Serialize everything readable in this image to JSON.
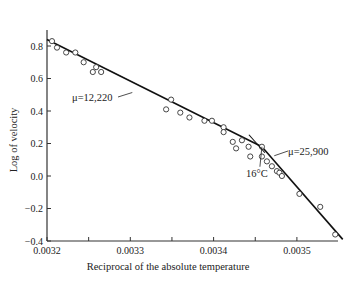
{
  "chart_data": {
    "type": "scatter",
    "title": "",
    "xlabel": "Reciprocal of the absolute temperature",
    "ylabel": "Log of velocity",
    "xlim": [
      0.0032,
      0.003555
    ],
    "ylim": [
      -0.4,
      0.9
    ],
    "xticks": [
      0.0032,
      0.0033,
      0.0034,
      0.0035
    ],
    "xtick_labels": [
      "0.0032",
      "0.0033",
      "0.0034",
      "0.0035"
    ],
    "x_minor_ticks": [
      0.00325,
      0.00335,
      0.00345
    ],
    "yticks": [
      0.8,
      0.6,
      0.4,
      0.2,
      0.0,
      -0.2,
      -0.4
    ],
    "ytick_labels": [
      "0.8",
      "0.6",
      "0.4",
      "0.2",
      "0.0",
      "−0.2",
      "−0.4"
    ],
    "grid": false,
    "points": [
      {
        "x": 0.003206,
        "y": 0.83
      },
      {
        "x": 0.003212,
        "y": 0.79
      },
      {
        "x": 0.003223,
        "y": 0.76
      },
      {
        "x": 0.003234,
        "y": 0.76
      },
      {
        "x": 0.003244,
        "y": 0.7
      },
      {
        "x": 0.003255,
        "y": 0.64
      },
      {
        "x": 0.003259,
        "y": 0.67
      },
      {
        "x": 0.003265,
        "y": 0.64
      },
      {
        "x": 0.003349,
        "y": 0.47
      },
      {
        "x": 0.003343,
        "y": 0.41
      },
      {
        "x": 0.00336,
        "y": 0.39
      },
      {
        "x": 0.003371,
        "y": 0.36
      },
      {
        "x": 0.003389,
        "y": 0.34
      },
      {
        "x": 0.003398,
        "y": 0.34
      },
      {
        "x": 0.003412,
        "y": 0.3
      },
      {
        "x": 0.003412,
        "y": 0.27
      },
      {
        "x": 0.003423,
        "y": 0.21
      },
      {
        "x": 0.003427,
        "y": 0.17
      },
      {
        "x": 0.003434,
        "y": 0.22
      },
      {
        "x": 0.003442,
        "y": 0.18
      },
      {
        "x": 0.003444,
        "y": 0.12
      },
      {
        "x": 0.003458,
        "y": 0.18
      },
      {
        "x": 0.003458,
        "y": 0.12
      },
      {
        "x": 0.003464,
        "y": 0.09
      },
      {
        "x": 0.00347,
        "y": 0.06
      },
      {
        "x": 0.003476,
        "y": 0.03
      },
      {
        "x": 0.003479,
        "y": 0.02
      },
      {
        "x": 0.003482,
        "y": 0.0
      },
      {
        "x": 0.003503,
        "y": -0.11
      },
      {
        "x": 0.003528,
        "y": -0.19
      },
      {
        "x": 0.003546,
        "y": -0.36
      }
    ],
    "fit_lines": [
      {
        "name": "μ=12,220",
        "x": [
          0.0032,
          0.003458
        ],
        "y": [
          0.84,
          0.18
        ]
      },
      {
        "name": "μ=25,900",
        "x": [
          0.003458,
          0.003555
        ],
        "y": [
          0.18,
          -0.39
        ]
      }
    ],
    "annotations": [
      {
        "text": "μ=12,220",
        "target_x": 0.0033,
        "target_y": 0.6
      },
      {
        "text": "μ=25,900",
        "target_x": 0.003468,
        "target_y": 0.1
      },
      {
        "text": "16°C",
        "target_x": 0.003458,
        "target_y": 0.18
      }
    ]
  }
}
